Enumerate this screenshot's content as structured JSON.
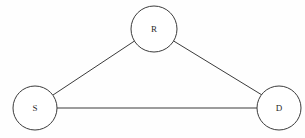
{
  "diagram": {
    "type": "node-link-graph",
    "canvas": {
      "width": 305,
      "height": 138
    },
    "style": {
      "background_color": "#fefefe",
      "node_fill": "#ffffff",
      "node_stroke": "#3b3b3b",
      "edge_stroke": "#3b3b3b",
      "label_color": "#2a2a2a",
      "stroke_width": 1
    },
    "nodes": [
      {
        "id": "S",
        "label": "S",
        "name": "source-node",
        "cx": 35,
        "cy": 108,
        "r": 22
      },
      {
        "id": "R",
        "label": "R",
        "name": "relay-node",
        "cx": 154,
        "cy": 29,
        "r": 23
      },
      {
        "id": "D",
        "label": "D",
        "name": "destination-node",
        "cx": 279,
        "cy": 108,
        "r": 22
      }
    ],
    "edges": [
      {
        "id": "S-R",
        "name": "edge-source-relay",
        "from": "S",
        "to": "R",
        "x1": 53,
        "y1": 95,
        "x2": 136,
        "y2": 40
      },
      {
        "id": "R-D",
        "name": "edge-relay-destination",
        "from": "R",
        "to": "D",
        "x1": 172,
        "y1": 40,
        "x2": 262,
        "y2": 95
      },
      {
        "id": "S-D",
        "name": "edge-source-destination",
        "from": "S",
        "to": "D",
        "x1": 57,
        "y1": 108,
        "x2": 257,
        "y2": 108
      }
    ]
  }
}
